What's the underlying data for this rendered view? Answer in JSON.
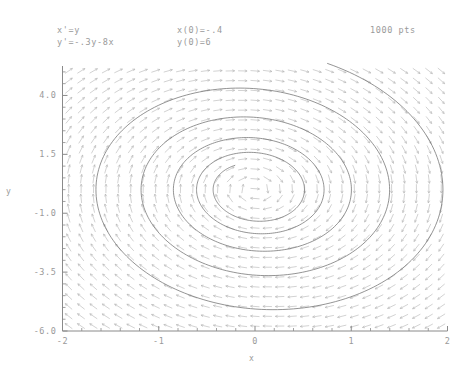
{
  "header": {
    "equation_1": "x'=y",
    "equation_2": "y'=-.3y-8x",
    "initial_1": "x(0)=-.4",
    "initial_2": "y(0)=6",
    "points_label": "1000 pts"
  },
  "chart_data": {
    "type": "line",
    "title": "",
    "subtitle": "",
    "xlabel": "x",
    "ylabel": "y",
    "xlim": [
      -2,
      2
    ],
    "ylim": [
      -6.0,
      5.25
    ],
    "xticks": [
      -2,
      -1,
      0,
      1,
      2
    ],
    "xticklabels": [
      "-2",
      "-1",
      "0",
      "1",
      "2"
    ],
    "yticks": [
      4.0,
      1.5,
      -1.0,
      -3.5,
      -6.0
    ],
    "yticklabels": [
      "4.0",
      "1.5",
      "-1.0",
      "-3.5",
      "-6.0"
    ],
    "grid": false,
    "legend": null,
    "line_color": "#707070",
    "field_color": "#b4b4b4",
    "axis_color": "#8a8a8a",
    "background": "#ffffff",
    "system": {
      "xdot": "y",
      "ydot": "-0.3*y - 8*x",
      "damping": 0.3,
      "stiffness": 8,
      "x0": -0.4,
      "y0": 6,
      "n_points": 1000,
      "t_max": 11.0
    },
    "direction_field": {
      "nx": 31,
      "ny": 27,
      "normalized": true,
      "arrow_len": 9
    },
    "series": [
      {
        "name": "trajectory",
        "description": "Spiral sink trajectory of damped oscillator x''+0.3x'+8x=0 from (-0.4, 6)"
      }
    ]
  }
}
